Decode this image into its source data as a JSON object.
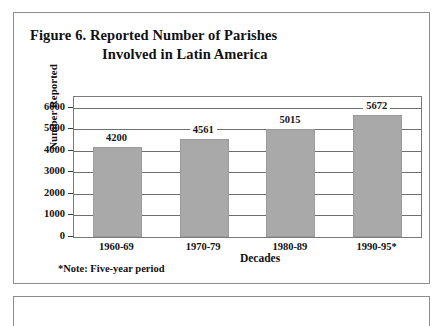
{
  "figure": {
    "title_line1": "Figure 6.  Reported Number of Parishes",
    "title_line2": "Involved in Latin America",
    "footnote": "*Note: Five-year period"
  },
  "chart_data": {
    "type": "bar",
    "title": "Figure 6.  Reported Number of Parishes Involved in Latin America",
    "categories": [
      "1960-69",
      "1970-79",
      "1980-89",
      "1990-95*"
    ],
    "values": [
      4200,
      4561,
      5015,
      5672
    ],
    "data_labels": [
      "4200",
      "4561",
      "5015",
      "5672"
    ],
    "xlabel": "Decades",
    "ylabel": "Number Reported",
    "ylim": [
      0,
      6500
    ],
    "yticks": [
      0,
      1000,
      2000,
      3000,
      4000,
      5000,
      6000
    ],
    "ytick_labels": [
      "0",
      "1000",
      "2000",
      "3000",
      "4000",
      "5000",
      "6000"
    ],
    "grid": true,
    "legend": false,
    "bar_color": "#a9a9a9",
    "plot_background": "#ffffff",
    "note": "*Note: Five-year period"
  }
}
